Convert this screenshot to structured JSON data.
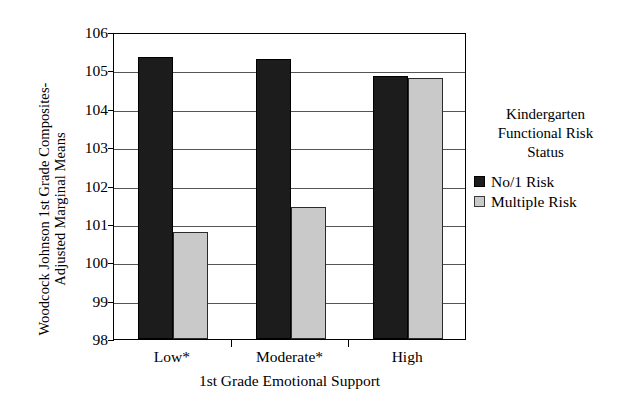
{
  "chart_data": {
    "type": "bar",
    "title": "",
    "xlabel": "1st Grade Emotional Support",
    "ylabel": "Woodcock Johnson 1st Grade Composites-Adjusted Marginal Means",
    "ylabel_lines": [
      "Woodcock Johnson 1st Grade Composites-",
      "Adjusted Marginal Means"
    ],
    "categories": [
      "Low*",
      "Moderate*",
      "High"
    ],
    "yticks": [
      98,
      99,
      100,
      101,
      102,
      103,
      104,
      105,
      106
    ],
    "ylim": [
      98,
      106
    ],
    "grid": true,
    "legend_position": "right",
    "legend_title": "Kindergarten Functional Risk Status",
    "legend_title_lines": [
      "Kindergarten",
      "Functional Risk",
      "Status"
    ],
    "series": [
      {
        "name": "No/1 Risk",
        "color": "#1c1c1c",
        "values": [
          105.35,
          105.3,
          104.85
        ]
      },
      {
        "name": "Multiple Risk",
        "color": "#c9c9c9",
        "values": [
          100.8,
          101.45,
          104.8
        ]
      }
    ]
  },
  "colors": {
    "series_dark": "#1c1c1c",
    "series_light": "#c9c9c9",
    "axis": "#000000",
    "grid": "#555555",
    "background": "#ffffff"
  }
}
